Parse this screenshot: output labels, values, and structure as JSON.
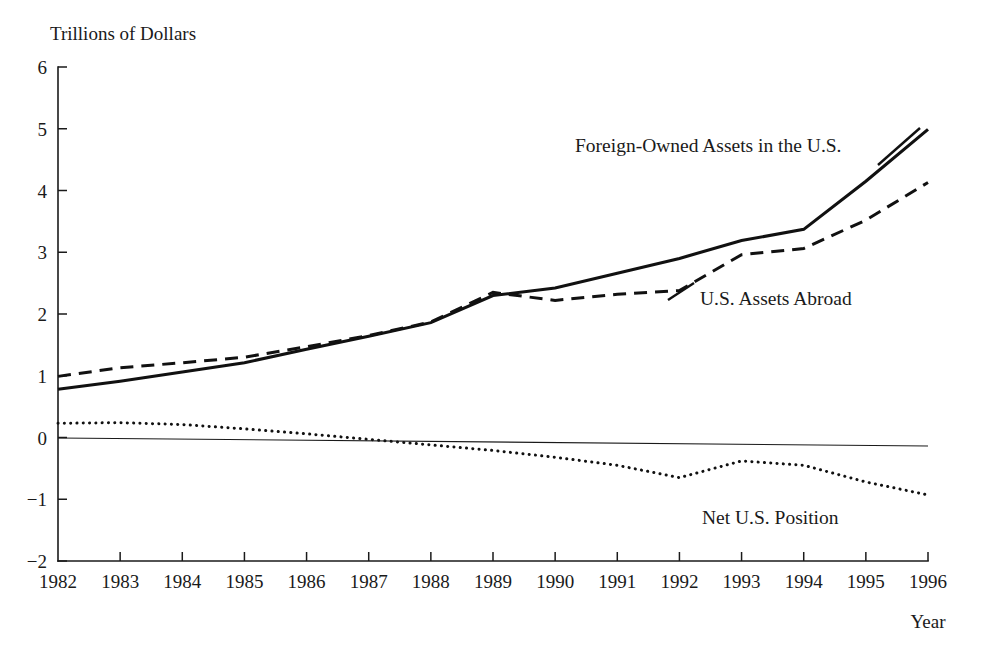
{
  "chart_data": {
    "type": "line",
    "title": "Trillions of Dollars",
    "xlabel": "Year",
    "ylabel": "Trillions of Dollars",
    "grid": false,
    "legend_position": "inline-annotations",
    "x": [
      1982,
      1983,
      1984,
      1985,
      1986,
      1987,
      1988,
      1989,
      1990,
      1991,
      1992,
      1993,
      1994,
      1995,
      1996
    ],
    "xlim": [
      1982,
      1996
    ],
    "ylim": [
      -2,
      6
    ],
    "y_ticks": [
      -2,
      -1,
      0,
      1,
      2,
      3,
      4,
      5,
      6
    ],
    "y_tick_labels": [
      "-2",
      "-1",
      "0",
      "1",
      "2",
      "3",
      "4",
      "5",
      "6"
    ],
    "x_ticks": [
      1982,
      1983,
      1984,
      1985,
      1986,
      1987,
      1988,
      1989,
      1990,
      1991,
      1992,
      1993,
      1994,
      1995,
      1996
    ],
    "x_tick_labels": [
      "1982",
      "1983",
      "1984",
      "1985",
      "1986",
      "1987",
      "1988",
      "1989",
      "1990",
      "1991",
      "1992",
      "1993",
      "1994",
      "1995",
      "1996"
    ],
    "series": [
      {
        "name": "Foreign-Owned Assets in the U.S.",
        "style": "solid",
        "color": "#111111",
        "values": [
          0.78,
          0.91,
          1.06,
          1.21,
          1.43,
          1.64,
          1.86,
          2.3,
          2.42,
          2.66,
          2.9,
          3.19,
          3.37,
          4.15,
          4.99
        ]
      },
      {
        "name": "U.S. Assets Abroad",
        "style": "dashed",
        "color": "#111111",
        "values": [
          0.99,
          1.13,
          1.21,
          1.3,
          1.47,
          1.65,
          1.87,
          2.35,
          2.22,
          2.32,
          2.38,
          2.96,
          3.06,
          3.52,
          4.13
        ]
      },
      {
        "name": "Net U.S. Position",
        "style": "dotted",
        "color": "#111111",
        "values": [
          0.23,
          0.24,
          0.21,
          0.14,
          0.06,
          -0.03,
          -0.12,
          -0.21,
          -0.32,
          -0.45,
          -0.65,
          -0.38,
          -0.45,
          -0.72,
          -0.93
        ]
      }
    ],
    "annotations": [
      {
        "text": "Foreign-Owned Assets in the U.S.",
        "x_px": 575,
        "y_px": 152,
        "leader": {
          "x1": 878,
          "y1": 165,
          "x2": 920,
          "y2": 128
        }
      },
      {
        "text": "U.S. Assets Abroad",
        "x_px": 700,
        "y_px": 305,
        "leader": {
          "x1": 668,
          "y1": 300,
          "x2": 694,
          "y2": 283
        }
      },
      {
        "text": "Net U.S. Position",
        "x_px": 702,
        "y_px": 524,
        "leader": null
      }
    ]
  },
  "axes": {
    "y_axis_title": "Trillions of Dollars",
    "x_axis_title": "Year"
  }
}
